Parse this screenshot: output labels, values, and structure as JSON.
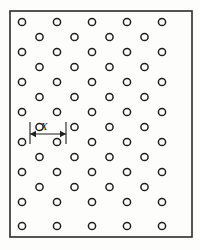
{
  "figure": {
    "background_color": "#fdfdfc"
  },
  "frame": {
    "name": "plate-outline",
    "x": 10,
    "y": 11,
    "width": 182,
    "height": 226,
    "stroke_color": "#2b2b2b",
    "stroke_width": 1.6,
    "fill_color": "#fdfdfc"
  },
  "circles": {
    "radius": 3.6,
    "stroke_color": "#1f1f1f",
    "stroke_width": 1.5,
    "fill_color": "none",
    "full_row_x": [
      22,
      57,
      92,
      127,
      162
    ],
    "offset_row_x": [
      39.5,
      74.5,
      109.5,
      144.5
    ],
    "full_row_y": [
      22,
      52,
      82,
      112,
      142,
      172,
      202
    ],
    "offset_row_y": [
      37,
      67,
      97,
      127,
      157,
      187
    ],
    "bottom_row_y": 226,
    "full_row_count": 5,
    "offset_row_count": 4,
    "total_rows": 14
  },
  "dimension": {
    "name": "pitch-dimension-x",
    "label": "X",
    "label_x": 44,
    "label_y": 130,
    "arrow_y": 134,
    "left_x": 30,
    "right_x": 66,
    "extension_top_y": 122,
    "extension_bottom_y": 144,
    "line_color": "#1f1f1f",
    "line_width": 1.1,
    "arrow_head_length": 6,
    "arrow_head_width": 3.2
  }
}
